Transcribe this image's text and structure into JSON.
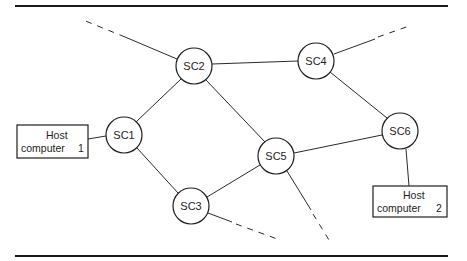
{
  "diagram": {
    "type": "network-topology",
    "nodes": [
      {
        "id": "SC1",
        "label": "SC1",
        "cx": 124,
        "cy": 135
      },
      {
        "id": "SC2",
        "label": "SC2",
        "cx": 194,
        "cy": 66
      },
      {
        "id": "SC3",
        "label": "SC3",
        "cx": 191,
        "cy": 206
      },
      {
        "id": "SC4",
        "label": "SC4",
        "cx": 316,
        "cy": 61
      },
      {
        "id": "SC5",
        "label": "SC5",
        "cx": 276,
        "cy": 156
      },
      {
        "id": "SC6",
        "label": "SC6",
        "cx": 400,
        "cy": 131
      }
    ],
    "hosts": [
      {
        "id": "host1",
        "line1": "Host",
        "line2": "computer",
        "number": "1",
        "attached_to": "SC1"
      },
      {
        "id": "host2",
        "line1": "Host",
        "line2": "computer",
        "number": "2",
        "attached_to": "SC6"
      }
    ],
    "links": [
      [
        "Host1",
        "SC1"
      ],
      [
        "SC1",
        "SC2"
      ],
      [
        "SC1",
        "SC3"
      ],
      [
        "SC2",
        "SC4"
      ],
      [
        "SC2",
        "SC5"
      ],
      [
        "SC3",
        "SC5"
      ],
      [
        "SC4",
        "SC6"
      ],
      [
        "SC5",
        "SC6"
      ],
      [
        "SC6",
        "Host2"
      ]
    ],
    "external_links": [
      {
        "from": "SC2",
        "direction": "upper-left",
        "style": "dashed"
      },
      {
        "from": "SC4",
        "direction": "upper-right",
        "style": "dashed"
      },
      {
        "from": "SC3",
        "direction": "lower-right",
        "style": "dashed"
      },
      {
        "from": "SC5",
        "direction": "down",
        "style": "dashed"
      }
    ]
  }
}
